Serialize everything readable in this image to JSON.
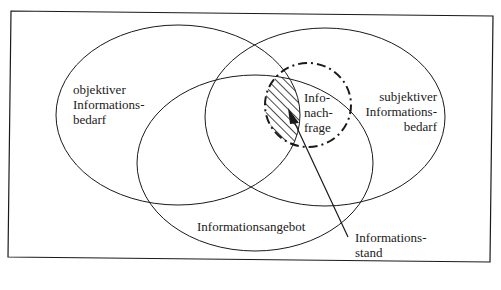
{
  "diagram": {
    "sets": {
      "objective_need": {
        "label_lines": [
          "objektiver",
          "Informations-",
          "bedarf"
        ]
      },
      "subjective_need": {
        "label_lines": [
          "subjektiver",
          "Informations-",
          "bedarf"
        ]
      },
      "information_supply": {
        "label": "Informationsangebot"
      },
      "information_demand": {
        "label_lines": [
          "Info-",
          "nach-",
          "frage"
        ]
      }
    },
    "pointer_label_lines": [
      "Informations-",
      "stand"
    ],
    "colors": {
      "stroke": "#1a1a1a",
      "background": "#ffffff"
    }
  }
}
